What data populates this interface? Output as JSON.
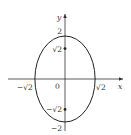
{
  "chart_data": {
    "type": "line",
    "title": "",
    "xlabel": "x",
    "ylabel": "y",
    "curve": {
      "name": "ellipse",
      "equation": "x^2/2 + y^2/4 = 1",
      "semi_axis_x": 1.41421356,
      "semi_axis_y": 2
    },
    "marked_points": [
      {
        "x": 0,
        "y": 1.41421356,
        "label": "√2"
      },
      {
        "x": 0,
        "y": -1.41421356,
        "label": "−√2"
      }
    ],
    "tick_labels": {
      "x": [
        {
          "value": -1.41421356,
          "label": "−√2"
        },
        {
          "value": 1.41421356,
          "label": "√2"
        }
      ],
      "y": [
        {
          "value": 2,
          "label": "2"
        },
        {
          "value": 1.41421356,
          "label": "√2"
        },
        {
          "value": -1.41421356,
          "label": "−√2"
        },
        {
          "value": -2,
          "label": "−2"
        }
      ],
      "origin": "0"
    },
    "xlim": [
      -2.5,
      2.5
    ],
    "ylim": [
      -2.4,
      2.6
    ],
    "grid": false,
    "legend": "none"
  }
}
